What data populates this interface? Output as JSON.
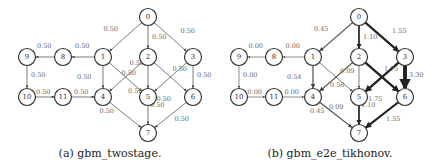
{
  "figures": [
    {
      "caption": "(a) gbm_twostage.",
      "source_node": "0",
      "sink_node": "7",
      "colors": {
        "source": "#c4c4c4",
        "sink": "#6e6e6e",
        "edge": "#444444",
        "node_border": "#333333"
      },
      "nodes": [
        "0",
        "1",
        "2",
        "3",
        "4",
        "5",
        "6",
        "7",
        "8",
        "9",
        "10",
        "11"
      ],
      "edges": [
        {
          "from": "0",
          "to": "1",
          "label": "0.50",
          "weight": 0.5
        },
        {
          "from": "0",
          "to": "2",
          "label": "0.50",
          "weight": 0.5
        },
        {
          "from": "0",
          "to": "3",
          "label": "0.50",
          "weight": 0.5
        },
        {
          "from": "1",
          "to": "8",
          "label": "0.50",
          "weight": 0.5
        },
        {
          "from": "8",
          "to": "9",
          "label": "0.50",
          "weight": 0.5
        },
        {
          "from": "9",
          "to": "10",
          "label": "0.50",
          "weight": 0.5
        },
        {
          "from": "10",
          "to": "11",
          "label": "0.50",
          "weight": 0.5
        },
        {
          "from": "11",
          "to": "4",
          "label": "0.50",
          "weight": 0.5
        },
        {
          "from": "1",
          "to": "4",
          "label": "0.50",
          "weight": 0.5
        },
        {
          "from": "1",
          "to": "5",
          "label": "0.50",
          "weight": 0.5
        },
        {
          "from": "2",
          "to": "4",
          "label": "0.50",
          "weight": 0.5
        },
        {
          "from": "2",
          "to": "5",
          "label": "0.50",
          "weight": 0.5
        },
        {
          "from": "2",
          "to": "6",
          "label": "0.50",
          "weight": 0.5
        },
        {
          "from": "3",
          "to": "5",
          "label": "0.50",
          "weight": 0.5
        },
        {
          "from": "3",
          "to": "6",
          "label": "0.50",
          "weight": 0.5
        },
        {
          "from": "4",
          "to": "7",
          "label": "0.50",
          "weight": 0.5
        },
        {
          "from": "5",
          "to": "7",
          "label": "0.50",
          "weight": 0.5
        },
        {
          "from": "6",
          "to": "7",
          "label": "0.50",
          "weight": 0.5
        }
      ]
    },
    {
      "caption": "(b) gbm_e2e_tikhonov.",
      "source_node": "0",
      "sink_node": "7",
      "colors": {
        "source": "#c4c4c4",
        "sink": "#6e6e6e",
        "edge": "#444444",
        "node_border": "#333333"
      },
      "nodes": [
        "0",
        "1",
        "2",
        "3",
        "4",
        "5",
        "6",
        "7",
        "8",
        "9",
        "10",
        "11"
      ],
      "edges": [
        {
          "from": "0",
          "to": "1",
          "label": "0.45",
          "weight": 0.45
        },
        {
          "from": "0",
          "to": "2",
          "label": "1.10",
          "weight": 1.1
        },
        {
          "from": "0",
          "to": "3",
          "label": "1.55",
          "weight": 1.55
        },
        {
          "from": "1",
          "to": "8",
          "label": "0.00",
          "weight": 0.0
        },
        {
          "from": "8",
          "to": "9",
          "label": "0.00",
          "weight": 0.0
        },
        {
          "from": "9",
          "to": "10",
          "label": "0.00",
          "weight": 0.0
        },
        {
          "from": "10",
          "to": "11",
          "label": "0.00",
          "weight": 0.0
        },
        {
          "from": "11",
          "to": "4",
          "label": "0.00",
          "weight": 0.0
        },
        {
          "from": "1",
          "to": "4",
          "label": "0.54",
          "weight": 0.54
        },
        {
          "from": "1",
          "to": "5",
          "label": "0.09",
          "weight": 0.09
        },
        {
          "from": "2",
          "to": "4",
          "label": "0.56",
          "weight": 0.56
        },
        {
          "from": "2",
          "to": "5",
          "label": "0.09",
          "weight": 0.09
        },
        {
          "from": "2",
          "to": "6",
          "label": "1.75",
          "weight": 1.75
        },
        {
          "from": "3",
          "to": "5",
          "label": "1.75",
          "weight": 1.75
        },
        {
          "from": "3",
          "to": "6",
          "label": "3.30",
          "weight": 3.3
        },
        {
          "from": "4",
          "to": "7",
          "label": "0.45",
          "weight": 0.45
        },
        {
          "from": "5",
          "to": "7",
          "label": "1.10",
          "weight": 1.1
        },
        {
          "from": "6",
          "to": "7",
          "label": "1.55",
          "weight": 1.55
        }
      ]
    }
  ]
}
